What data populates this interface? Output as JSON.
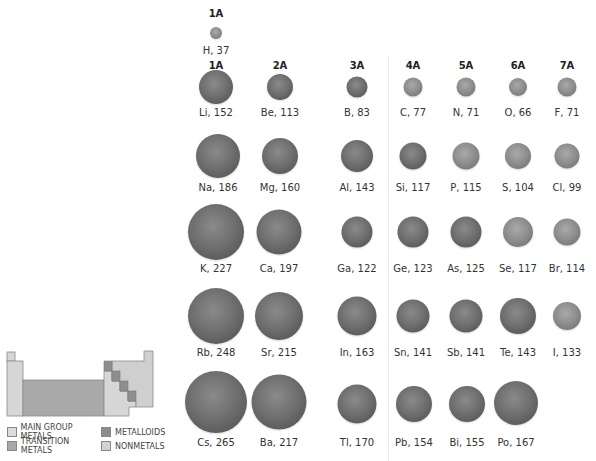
{
  "colors": {
    "main_group_metals": "#d9d9d9",
    "transition_metals": "#a8a8a8",
    "metalloids": "#8c8c8c",
    "nonmetals": "#cfcfcf",
    "sphere_dark": "#6e6e6e",
    "sphere_light": "#8f8f8f"
  },
  "top_header": "1A",
  "groups": [
    "1A",
    "2A",
    "3A",
    "4A",
    "5A",
    "6A",
    "7A"
  ],
  "hydrogen": {
    "symbol": "H",
    "radius_pm": 37,
    "label": "H, 37"
  },
  "rows": [
    [
      {
        "symbol": "Li",
        "radius_pm": 152,
        "label": "Li, 152"
      },
      {
        "symbol": "Be",
        "radius_pm": 113,
        "label": "Be, 113"
      },
      {
        "symbol": "B",
        "radius_pm": 83,
        "label": "B, 83"
      },
      {
        "symbol": "C",
        "radius_pm": 77,
        "label": "C, 77"
      },
      {
        "symbol": "N",
        "radius_pm": 71,
        "label": "N, 71"
      },
      {
        "symbol": "O",
        "radius_pm": 66,
        "label": "O, 66"
      },
      {
        "symbol": "F",
        "radius_pm": 71,
        "label": "F, 71"
      }
    ],
    [
      {
        "symbol": "Na",
        "radius_pm": 186,
        "label": "Na, 186"
      },
      {
        "symbol": "Mg",
        "radius_pm": 160,
        "label": "Mg, 160"
      },
      {
        "symbol": "Al",
        "radius_pm": 143,
        "label": "Al, 143"
      },
      {
        "symbol": "Si",
        "radius_pm": 117,
        "label": "Si, 117"
      },
      {
        "symbol": "P",
        "radius_pm": 115,
        "label": "P, 115"
      },
      {
        "symbol": "S",
        "radius_pm": 104,
        "label": "S, 104"
      },
      {
        "symbol": "Cl",
        "radius_pm": 99,
        "label": "Cl, 99"
      }
    ],
    [
      {
        "symbol": "K",
        "radius_pm": 227,
        "label": "K, 227"
      },
      {
        "symbol": "Ca",
        "radius_pm": 197,
        "label": "Ca, 197"
      },
      {
        "symbol": "Ga",
        "radius_pm": 122,
        "label": "Ga, 122"
      },
      {
        "symbol": "Ge",
        "radius_pm": 123,
        "label": "Ge, 123"
      },
      {
        "symbol": "As",
        "radius_pm": 125,
        "label": "As, 125"
      },
      {
        "symbol": "Se",
        "radius_pm": 117,
        "label": "Se, 117"
      },
      {
        "symbol": "Br",
        "radius_pm": 114,
        "label": "Br, 114"
      }
    ],
    [
      {
        "symbol": "Rb",
        "radius_pm": 248,
        "label": "Rb, 248"
      },
      {
        "symbol": "Sr",
        "radius_pm": 215,
        "label": "Sr, 215"
      },
      {
        "symbol": "In",
        "radius_pm": 163,
        "label": "In, 163"
      },
      {
        "symbol": "Sn",
        "radius_pm": 141,
        "label": "Sn, 141"
      },
      {
        "symbol": "Sb",
        "radius_pm": 141,
        "label": "Sb, 141"
      },
      {
        "symbol": "Te",
        "radius_pm": 143,
        "label": "Te, 143"
      },
      {
        "symbol": "I",
        "radius_pm": 133,
        "label": "I, 133"
      }
    ],
    [
      {
        "symbol": "Cs",
        "radius_pm": 265,
        "label": "Cs, 265"
      },
      {
        "symbol": "Ba",
        "radius_pm": 217,
        "label": "Ba, 217"
      },
      {
        "symbol": "Tl",
        "radius_pm": 170,
        "label": "Tl, 170"
      },
      {
        "symbol": "Pb",
        "radius_pm": 154,
        "label": "Pb, 154"
      },
      {
        "symbol": "Bi",
        "radius_pm": 155,
        "label": "Bi, 155"
      },
      {
        "symbol": "Po",
        "radius_pm": 167,
        "label": "Po, 167"
      }
    ]
  ],
  "legend": {
    "main_group_metals": "MAIN GROUP METALS",
    "metalloids": "METALLOIDS",
    "transition_metals": "TRANSITION METALS",
    "nonmetals": "NONMETALS"
  }
}
